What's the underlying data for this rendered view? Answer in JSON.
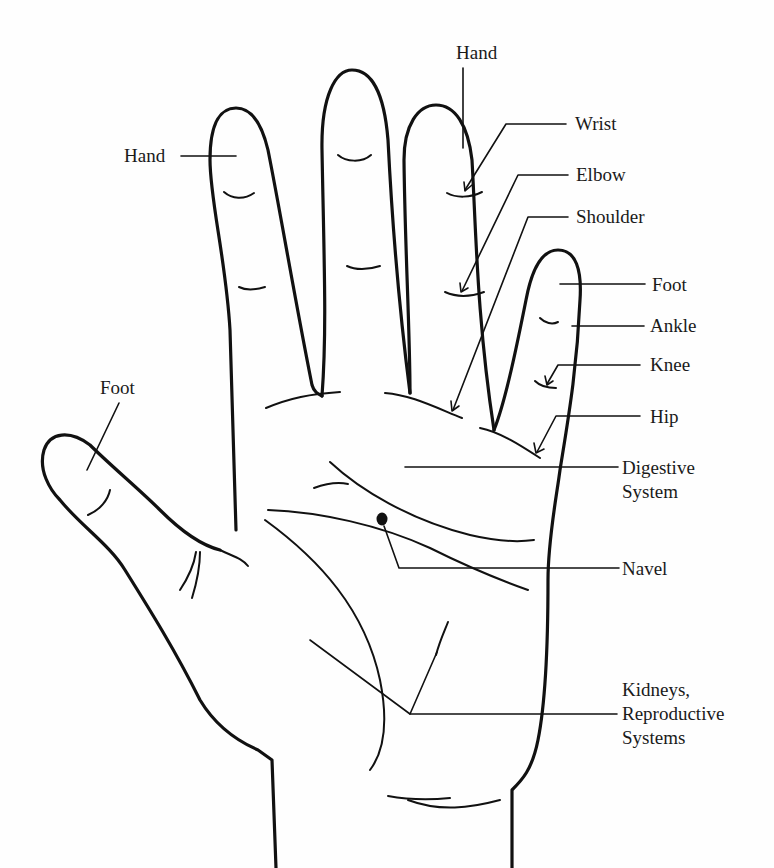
{
  "diagram": {
    "type": "hand-reflexology-map",
    "colors": {
      "line": "#111111",
      "background": "#fefefe",
      "text": "#1a1a1a"
    },
    "labels": {
      "hand_index": "Hand",
      "hand_ring": "Hand",
      "wrist": "Wrist",
      "elbow": "Elbow",
      "shoulder": "Shoulder",
      "foot_pinky": "Foot",
      "ankle": "Ankle",
      "knee": "Knee",
      "hip": "Hip",
      "foot_thumb": "Foot",
      "digestive_line1": "Digestive",
      "digestive_line2": "System",
      "navel": "Navel",
      "kidneys_line1": "Kidneys,",
      "kidneys_line2": "Reproductive",
      "kidneys_line3": "Systems"
    }
  }
}
